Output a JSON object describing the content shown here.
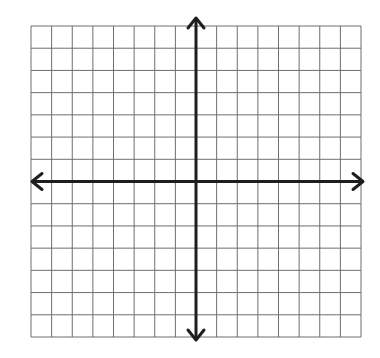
{
  "diagram": {
    "type": "coordinate-plane",
    "grid": {
      "columns": 16,
      "rows": 14,
      "left": 31,
      "top": 26,
      "right": 361,
      "bottom": 337,
      "line_color": "#6e6e6e"
    },
    "axes": {
      "origin_column": 8,
      "origin_row": 7,
      "color": "#1e1e1e",
      "x_axis": {
        "arrow_left": true,
        "arrow_right": true
      },
      "y_axis": {
        "arrow_up": true,
        "arrow_down": true
      }
    },
    "labels": []
  }
}
